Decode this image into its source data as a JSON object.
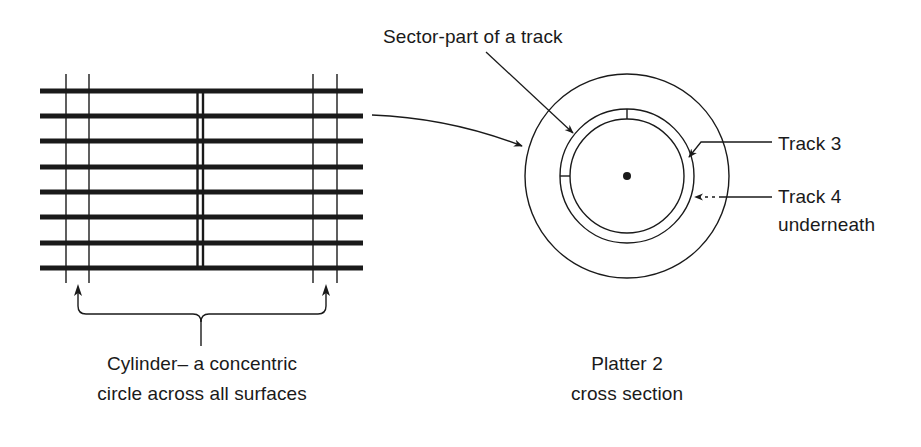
{
  "diagram": {
    "left_panel": {
      "name": "platter-stack-side-view",
      "platter_count": 8,
      "caption_lines": [
        "Cylinder– a concentric",
        "circle across all surfaces"
      ]
    },
    "right_panel": {
      "name": "platter-cross-section",
      "caption_lines": [
        "Platter 2",
        "cross section"
      ],
      "labels": {
        "sector": "Sector-part of a track",
        "track3": "Track 3",
        "track4_lines": [
          "Track 4",
          "underneath"
        ]
      }
    },
    "colors": {
      "ink": "#1a1a1a",
      "background": "#ffffff"
    }
  }
}
